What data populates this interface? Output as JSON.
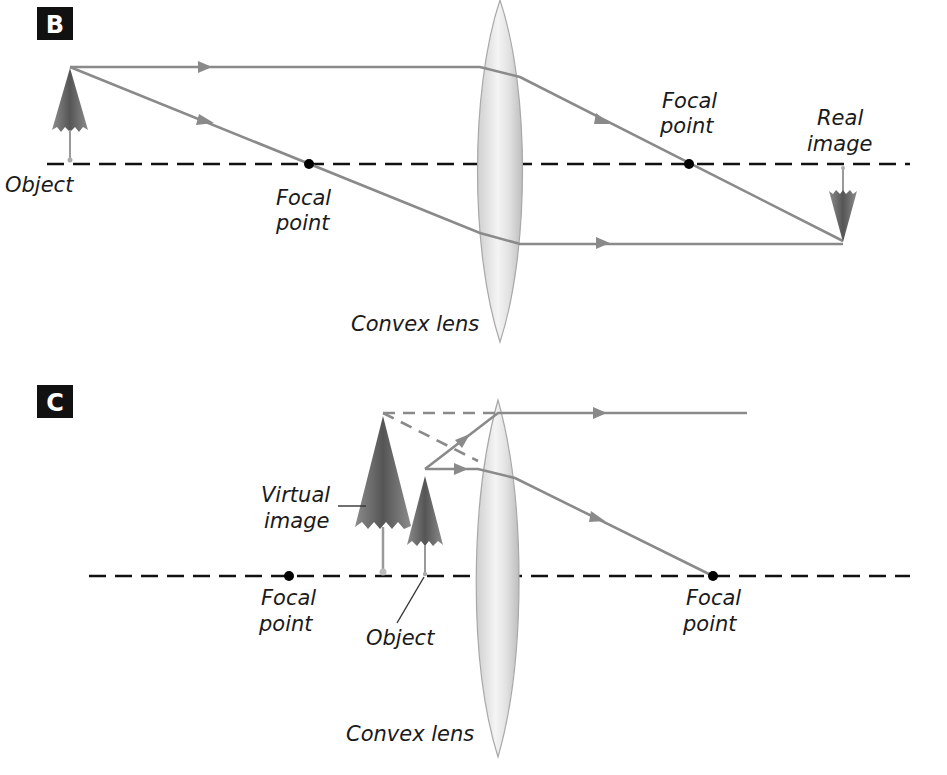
{
  "panels": [
    {
      "id": "B",
      "letter": "B",
      "labels": {
        "object": "Object",
        "focal_left_1": "Focal",
        "focal_left_2": "point",
        "focal_right_1": "Focal",
        "focal_right_2": "point",
        "real_image_1": "Real",
        "real_image_2": "image",
        "lens": "Convex lens"
      }
    },
    {
      "id": "C",
      "letter": "C",
      "labels": {
        "virtual_image_1": "Virtual",
        "virtual_image_2": "image",
        "object": "Object",
        "focal_left_1": "Focal",
        "focal_left_2": "point",
        "focal_right_1": "Focal",
        "focal_right_2": "point",
        "lens": "Convex lens"
      }
    }
  ],
  "colors": {
    "ray": "#8a8a8a",
    "axis": "#111111",
    "lens": "#e6e6e6",
    "umbrella": "#6e6e6e",
    "panel_badge": "#111111"
  }
}
